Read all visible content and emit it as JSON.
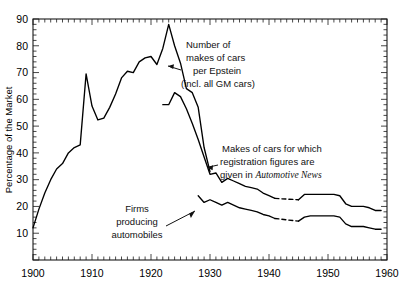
{
  "chart_data": {
    "type": "line",
    "title": "",
    "subtitle": "",
    "xlabel": "",
    "ylabel": "Percentage of the Market",
    "xlim": [
      1900,
      1960
    ],
    "ylim": [
      0,
      90
    ],
    "yticks": [
      10,
      20,
      30,
      40,
      50,
      60,
      70,
      80,
      90
    ],
    "ytick_labels": [
      "10",
      "20",
      "30",
      "40",
      "50",
      "60",
      "70",
      "80",
      "90"
    ],
    "xticks": [
      1900,
      1910,
      1920,
      1930,
      1940,
      1950,
      1960
    ],
    "xtick_labels": [
      "1900",
      "1910",
      "1920",
      "1930",
      "1940",
      "1950",
      "1960"
    ],
    "minor_xtick_interval": 1,
    "minor_ytick_interval": 2,
    "grid": false,
    "legend": "none (inline annotations with leader lines)",
    "frame": "full box, ticks pointing inward",
    "series": [
      {
        "name": "Number of makes of cars per Epstein (incl. all GM cars)",
        "color": "#000000",
        "x": [
          1900,
          1901,
          1902,
          1903,
          1904,
          1905,
          1906,
          1907,
          1908,
          1909,
          1910,
          1911,
          1912,
          1913,
          1914,
          1915,
          1916,
          1917,
          1918,
          1919,
          1920,
          1921,
          1922,
          1923,
          1924,
          1925,
          1926,
          1927,
          1928,
          1929,
          1930
        ],
        "y": [
          12,
          19,
          25,
          30,
          34,
          36,
          40,
          42,
          43,
          69.5,
          57.5,
          52.3,
          53,
          57,
          62,
          68,
          70.5,
          70,
          74,
          75.5,
          76,
          73,
          79,
          88,
          80,
          73.5,
          64,
          62.5,
          57,
          42,
          33
        ]
      },
      {
        "name": "Makes of cars for which registration figures are given in Automotive News",
        "color": "#000000",
        "x": [
          1922,
          1923,
          1924,
          1925,
          1926,
          1927,
          1928,
          1929,
          1930,
          1931,
          1932,
          1933,
          1934,
          1935,
          1936,
          1937,
          1938,
          1939,
          1940,
          1941,
          1945,
          1946,
          1947,
          1948,
          1949,
          1950,
          1951,
          1952,
          1953,
          1954,
          1955,
          1956,
          1957,
          1958,
          1959
        ],
        "y": [
          58,
          58,
          62.5,
          61,
          56.5,
          51,
          45,
          38.5,
          32,
          32.5,
          29,
          30.5,
          29.5,
          28.5,
          27.5,
          27,
          26.5,
          25,
          24,
          23,
          22.5,
          24.5,
          24.5,
          24.5,
          24.5,
          24.5,
          24.5,
          24,
          21,
          20,
          20,
          20,
          19.5,
          18.5,
          18.5
        ],
        "dashed_gap": [
          1941,
          1945
        ]
      },
      {
        "name": "Firms producing automobiles",
        "color": "#000000",
        "x": [
          1928,
          1929,
          1930,
          1931,
          1932,
          1933,
          1934,
          1935,
          1936,
          1937,
          1938,
          1939,
          1940,
          1941,
          1945,
          1946,
          1947,
          1948,
          1949,
          1950,
          1951,
          1952,
          1953,
          1954,
          1955,
          1956,
          1957,
          1958,
          1959
        ],
        "y": [
          24,
          21.5,
          22.5,
          21.5,
          20.5,
          21.5,
          20.5,
          19.5,
          19,
          18.5,
          18,
          17,
          16.5,
          15.5,
          14.5,
          16,
          16.5,
          16.5,
          16.5,
          16.5,
          16.5,
          16,
          13.5,
          12.5,
          12.5,
          12.5,
          12,
          11.5,
          11.5
        ],
        "dashed_gap": [
          1941,
          1945
        ]
      }
    ],
    "annotations": [
      {
        "id": "epstein",
        "lines": [
          "Number of",
          "makes of cars",
          "per Epstein",
          "(incl. all GM cars)"
        ],
        "italic_part": "",
        "leader": "arrow pointing left-down to the upper curve near 1925"
      },
      {
        "id": "automotive-news",
        "lines": [
          "Makes of cars for which",
          "registration figures are",
          "given in "
        ],
        "italic_part": "Automotive News",
        "leader": "arrow pointing left to the middle curve near 1931"
      },
      {
        "id": "firms",
        "lines": [
          "Firms",
          "producing",
          "automobiles"
        ],
        "italic_part": "",
        "leader": "arrow pointing right-up to the lower curve near 1929"
      }
    ]
  },
  "axes": {
    "ylabel": "Percentage of the Market",
    "y_tick_labels": [
      "10",
      "20",
      "30",
      "40",
      "50",
      "60",
      "70",
      "80",
      "90"
    ],
    "x_tick_labels": [
      "1900",
      "1910",
      "1920",
      "1930",
      "1940",
      "1950",
      "1960"
    ]
  },
  "annotation_text": {
    "epstein_l1": "Number of",
    "epstein_l2": "makes of cars",
    "epstein_l3": "per Epstein",
    "epstein_l4": "(incl. all GM cars)",
    "autonews_l1": "Makes of cars for which",
    "autonews_l2": "registration figures are",
    "autonews_l3_prefix": "given in ",
    "autonews_l3_italic": "Automotive News",
    "firms_l1": "Firms",
    "firms_l2": "producing",
    "firms_l3": "automobiles"
  },
  "colors": {
    "line": "#000000",
    "axis": "#1a1a1a",
    "background": "#ffffff"
  }
}
